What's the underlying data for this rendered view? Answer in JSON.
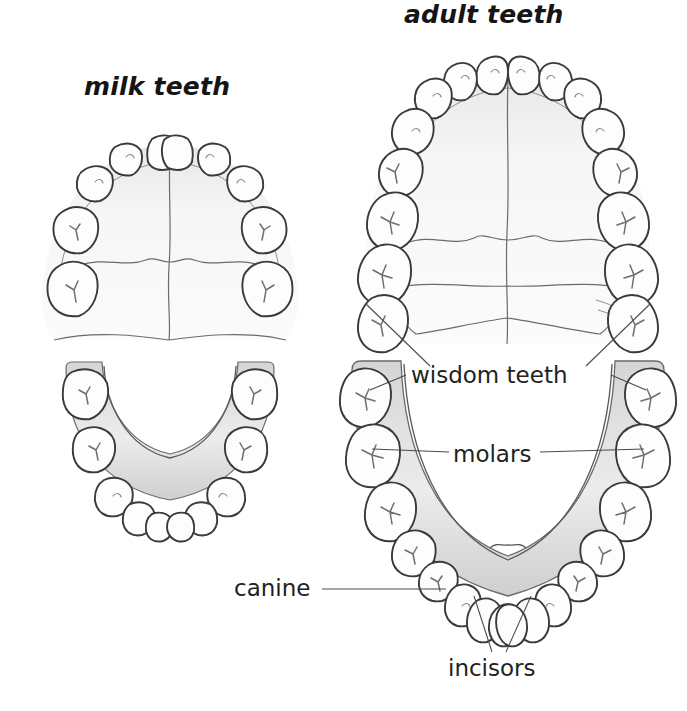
{
  "figure": {
    "background_color": "#ffffff",
    "ink_color": "#3a3a3a"
  },
  "headings": {
    "milk": "milk teeth",
    "adult": "adult teeth"
  },
  "callouts": {
    "wisdom": "wisdom teeth",
    "molars": "molars",
    "canine": "canine",
    "incisors": "incisors"
  },
  "arches": [
    {
      "id": "milk-upper",
      "name": "milk teeth upper arch",
      "jaw": "upper",
      "dentition": "deciduous",
      "tooth_count": 10,
      "teeth_per_side": [
        "central incisor",
        "lateral incisor",
        "canine",
        "first molar",
        "second molar"
      ]
    },
    {
      "id": "milk-lower",
      "name": "milk teeth lower arch",
      "jaw": "lower",
      "dentition": "deciduous",
      "tooth_count": 10,
      "teeth_per_side": [
        "central incisor",
        "lateral incisor",
        "canine",
        "first molar",
        "second molar"
      ]
    },
    {
      "id": "adult-upper",
      "name": "adult teeth upper arch",
      "jaw": "upper",
      "dentition": "permanent",
      "tooth_count": 16,
      "teeth_per_side": [
        "central incisor",
        "lateral incisor",
        "canine",
        "first premolar",
        "second premolar",
        "first molar",
        "second molar",
        "wisdom tooth"
      ]
    },
    {
      "id": "adult-lower",
      "name": "adult teeth lower arch",
      "jaw": "lower",
      "dentition": "permanent",
      "tooth_count": 16,
      "teeth_per_side": [
        "central incisor",
        "lateral incisor",
        "canine",
        "first premolar",
        "second premolar",
        "first molar",
        "second molar",
        "wisdom tooth"
      ]
    }
  ]
}
